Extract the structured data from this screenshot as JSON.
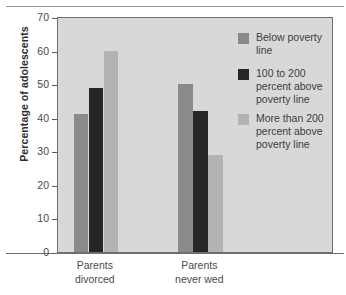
{
  "chart_data": {
    "type": "bar",
    "title": "",
    "subtitle": "",
    "xlabel": "",
    "ylabel": "Percentage of adolescents",
    "ylim": [
      0,
      70
    ],
    "ytick_step": 10,
    "yticks": [
      70,
      60,
      50,
      40,
      30,
      20,
      10,
      0
    ],
    "grid": false,
    "legend_position": "inside-top-right",
    "categories": [
      "Parents divorced",
      "Parents never wed"
    ],
    "category_lines": [
      [
        "Parents",
        "divorced"
      ],
      [
        "Parents",
        "never wed"
      ]
    ],
    "series": [
      {
        "name": "Below poverty line",
        "values": [
          41,
          50
        ],
        "color": "#8a8a8a"
      },
      {
        "name": "100 to 200 percent above poverty line",
        "values": [
          49,
          42
        ],
        "color": "#262626"
      },
      {
        "name": "More than 200 percent above poverty line",
        "values": [
          60,
          29
        ],
        "color": "#b3b3b3"
      }
    ]
  },
  "axes": {
    "y_title": "Percentage of adolescents",
    "y_tick_labels": [
      "70",
      "60",
      "50",
      "40",
      "30",
      "20",
      "10",
      "0"
    ],
    "x_tick_labels": [
      {
        "line1": "Parents",
        "line2": "divorced"
      },
      {
        "line1": "Parents",
        "line2": "never wed"
      }
    ]
  },
  "legend": {
    "items": [
      {
        "label_line1": "Below poverty",
        "label_line2": "line",
        "label_line3": "",
        "color": "#8a8a8a"
      },
      {
        "label_line1": "100 to 200",
        "label_line2": "percent above",
        "label_line3": "poverty line",
        "color": "#262626"
      },
      {
        "label_line1": "More than 200",
        "label_line2": "percent above",
        "label_line3": "poverty line",
        "color": "#b3b3b3"
      }
    ]
  },
  "colors": {
    "plot_background": "#d8d8d8",
    "page_background": "#ffffff",
    "axis": "#6f6f6f",
    "text": "#3d3d3d"
  }
}
